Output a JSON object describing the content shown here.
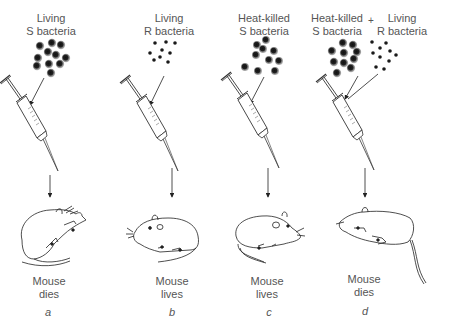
{
  "figure": {
    "panels": [
      {
        "id": "a",
        "injection_label_line1": "Living",
        "injection_label_line2": "S bacteria",
        "bacteria_type": "smooth-capsule",
        "outcome_line1": "Mouse",
        "outcome_line2": "dies",
        "letter": "a"
      },
      {
        "id": "b",
        "injection_label_line1": "Living",
        "injection_label_line2": "R bacteria",
        "bacteria_type": "rough",
        "outcome_line1": "Mouse",
        "outcome_line2": "lives",
        "letter": "b"
      },
      {
        "id": "c",
        "injection_label_line1": "Heat-killed",
        "injection_label_line2": "S bacteria",
        "bacteria_type": "smooth-capsule",
        "outcome_line1": "Mouse",
        "outcome_line2": "lives",
        "letter": "c"
      },
      {
        "id": "d",
        "injection_label_line1": "Heat-killed",
        "injection_label_line2": "S bacteria",
        "plus_sign": "+",
        "second_label_line1": "Living",
        "second_label_line2": "R bacteria",
        "bacteria_type": "mixed",
        "outcome_line1": "Mouse",
        "outcome_line2": "dies",
        "letter": "d"
      }
    ]
  },
  "colors": {
    "ink": "#222222",
    "text": "#555555",
    "capsule": "#9a9a9a",
    "background": "#ffffff"
  }
}
